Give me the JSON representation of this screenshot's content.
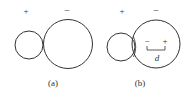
{
  "panels": [
    {
      "id": "a",
      "caption": "(a)",
      "left_sign": "+",
      "right_sign": "−"
    },
    {
      "id": "b",
      "caption": "(b)",
      "left_sign": "+",
      "right_sign": "−",
      "inner_minus": "−",
      "inner_plus": "+",
      "dimension_label": "d"
    }
  ],
  "colors": {
    "stroke": "#333333",
    "text": "#444444"
  }
}
